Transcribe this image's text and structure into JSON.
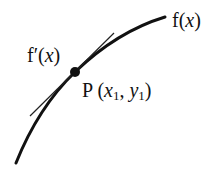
{
  "diagram": {
    "colors": {
      "curve": "#111111",
      "tangent": "#222222",
      "point": "#111111",
      "background": "#ffffff"
    },
    "curve": {
      "label_name": "f",
      "label_var": "x",
      "label_paren_open": "(",
      "label_paren_close": ")"
    },
    "tangent": {
      "label_name": "f′",
      "label_var": "x",
      "label_paren_open": "(",
      "label_paren_close": ")"
    },
    "point": {
      "name": "P",
      "open": " (",
      "x_var": "x",
      "x_sub": "1",
      "sep": ", ",
      "y_var": "y",
      "y_sub": "1",
      "close": ")"
    }
  }
}
